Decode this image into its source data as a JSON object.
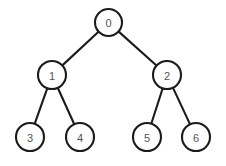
{
  "diagram": {
    "type": "binary-tree",
    "background_color": "#ffffff",
    "node_fill_color": "#ffffff",
    "node_stroke_color": "#1b1b1b",
    "edge_color": "#1b1b1b",
    "label_color": "#555555",
    "nodes": [
      {
        "id": "0",
        "label": "0",
        "cx": 108.5,
        "cy": 22.5,
        "r": 13.5,
        "depth": 0
      },
      {
        "id": "1",
        "label": "1",
        "cx": 52,
        "cy": 75,
        "r": 14,
        "depth": 1
      },
      {
        "id": "2",
        "label": "2",
        "cx": 167,
        "cy": 75,
        "r": 14,
        "depth": 1
      },
      {
        "id": "3",
        "label": "3",
        "cx": 30,
        "cy": 137,
        "r": 14,
        "depth": 2
      },
      {
        "id": "4",
        "label": "4",
        "cx": 80,
        "cy": 137,
        "r": 14,
        "depth": 2
      },
      {
        "id": "5",
        "label": "5",
        "cx": 147,
        "cy": 137,
        "r": 14,
        "depth": 2
      },
      {
        "id": "6",
        "label": "6",
        "cx": 196,
        "cy": 137,
        "r": 14,
        "depth": 2
      }
    ],
    "edges": [
      {
        "from": "0",
        "to": "1"
      },
      {
        "from": "0",
        "to": "2"
      },
      {
        "from": "1",
        "to": "3"
      },
      {
        "from": "1",
        "to": "4"
      },
      {
        "from": "2",
        "to": "5"
      },
      {
        "from": "2",
        "to": "6"
      }
    ]
  }
}
